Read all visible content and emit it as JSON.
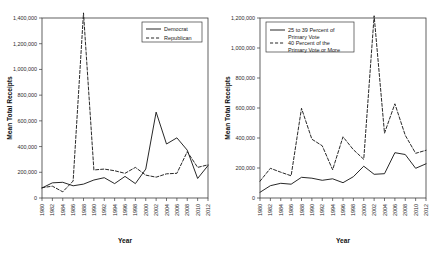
{
  "figure": {
    "panels": [
      "left",
      "right"
    ]
  },
  "chart_data": [
    {
      "type": "line",
      "panel": "left",
      "title": "",
      "xlabel": "Year",
      "ylabel": "Mean Total Receipts",
      "grid": false,
      "legend_position": "top-right",
      "xlim": [
        1980,
        2012
      ],
      "ylim": [
        0,
        1400000
      ],
      "yticks": [
        0,
        200000,
        400000,
        600000,
        800000,
        1000000,
        1200000,
        1400000
      ],
      "ytick_labels": [
        "0",
        "200,000",
        "400,000",
        "600,000",
        "800,000",
        "1,000,000",
        "1,200,000",
        "1,400,000"
      ],
      "x": [
        1980,
        1982,
        1984,
        1986,
        1988,
        1990,
        1992,
        1994,
        1996,
        1998,
        2000,
        2002,
        2004,
        2006,
        2008,
        2010,
        2012
      ],
      "xtick_labels": [
        "1980",
        "1982",
        "1984",
        "1986",
        "1988",
        "1990",
        "1992",
        "1994",
        "1996",
        "1998",
        "2000",
        "2002",
        "2004",
        "2006",
        "2008",
        "2010",
        "2012"
      ],
      "series": [
        {
          "name": "Democrat",
          "style": "solid",
          "values": [
            78000,
            118000,
            122000,
            95000,
            108000,
            140000,
            158000,
            112000,
            168000,
            112000,
            225000,
            668000,
            420000,
            468000,
            372000,
            152000,
            252000
          ]
        },
        {
          "name": "Republican",
          "style": "dashed",
          "values": [
            80000,
            92000,
            48000,
            132000,
            1440000,
            218000,
            225000,
            212000,
            192000,
            238000,
            178000,
            162000,
            188000,
            192000,
            360000,
            238000,
            258000
          ]
        }
      ]
    },
    {
      "type": "line",
      "panel": "right",
      "title": "",
      "xlabel": "Year",
      "ylabel": "Mean Total Receipts",
      "grid": false,
      "legend_position": "top-left",
      "xlim": [
        1980,
        2012
      ],
      "ylim": [
        0,
        1200000
      ],
      "yticks": [
        0,
        200000,
        400000,
        600000,
        800000,
        1000000,
        1200000
      ],
      "ytick_labels": [
        "0",
        "200,000",
        "400,000",
        "600,000",
        "800,000",
        "1,000,000",
        "1,200,000"
      ],
      "x": [
        1980,
        1982,
        1984,
        1986,
        1988,
        1990,
        1992,
        1994,
        1996,
        1998,
        2000,
        2002,
        2004,
        2006,
        2008,
        2010,
        2012
      ],
      "xtick_labels": [
        "1980",
        "1982",
        "1984",
        "1986",
        "1988",
        "1990",
        "1992",
        "1994",
        "1996",
        "1998",
        "2000",
        "2002",
        "2004",
        "2006",
        "2008",
        "2010",
        "2012"
      ],
      "series": [
        {
          "name": "25 to 39 Percent of Primary Vote",
          "style": "solid",
          "values": [
            38000,
            82000,
            98000,
            92000,
            138000,
            132000,
            118000,
            128000,
            102000,
            142000,
            212000,
            158000,
            162000,
            302000,
            290000,
            198000,
            228000
          ]
        },
        {
          "name": "40 Percent of the Primary Vote or More",
          "style": "dashed",
          "values": [
            112000,
            198000,
            172000,
            148000,
            598000,
            392000,
            348000,
            188000,
            408000,
            322000,
            258000,
            1215000,
            432000,
            628000,
            418000,
            298000,
            318000
          ]
        }
      ]
    }
  ],
  "legends": {
    "left": [
      {
        "label": "Democrat",
        "style": "solid"
      },
      {
        "label": "Republican",
        "style": "dashed"
      }
    ],
    "right": [
      {
        "label_line1": "25 to 39 Percent of",
        "label_line2": "Primary Vote",
        "style": "solid"
      },
      {
        "label_line1": "40 Percent of the",
        "label_line2": "Primary Vote or More",
        "style": "dashed"
      }
    ]
  }
}
